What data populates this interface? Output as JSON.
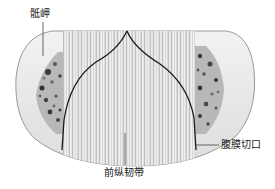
{
  "figure": {
    "colors": {
      "background": "#ffffff",
      "bone_outline": "#9a9a9a",
      "bone_fill": "#ececec",
      "ligament_light": "#f4f4f4",
      "ligament_dark": "#bdbdbd",
      "cancellous_dark": "#3a3a3a",
      "cancellous_light": "#b8b8b8",
      "incision_line": "#1a1a1a",
      "leader_line": "#444444",
      "label_text": "#222222"
    }
  },
  "labels": {
    "promontory": "骶岬",
    "ligament": "前纵韧带",
    "incision": "腹膜切口"
  }
}
